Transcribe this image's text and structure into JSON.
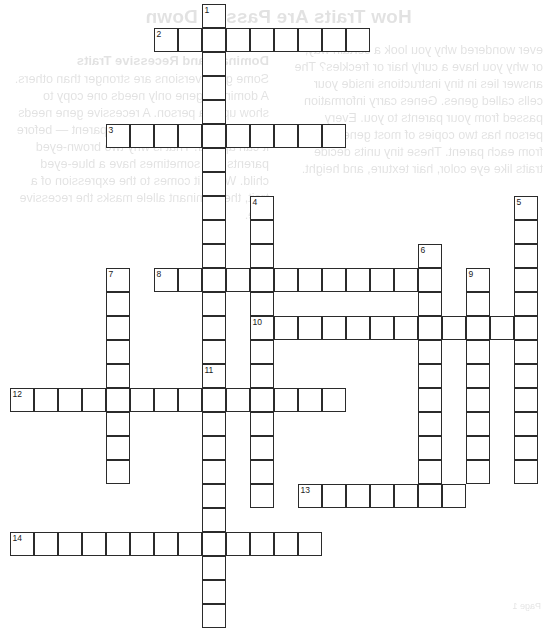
{
  "document": {
    "type": "crossword-puzzle-worksheet",
    "page_width": 557,
    "page_height": 617,
    "cell_size": 24
  },
  "bleed_through": {
    "note": "faint mirrored text showing through from the reverse side of the sheet",
    "title": "How Traits Are Passed Down",
    "left_column": "ever wondered why you look a certain way, or why you have a curly hair or freckles? The answer lies in tiny instructions inside your cells called genes. Genes carry information passed from your parents to you. Every person has two copies of most genes — one from each parent. These tiny units decide traits like eye color, hair texture, and height.",
    "right_heading": "Dominant and Recessive Traits",
    "right_column": "Some gene versions are stronger than others. A dominant gene only needs one copy to show up in a person. A recessive gene needs two copies — one from each parent — before it can appear. That is why two brown-eyed parents can sometimes have a blue-eyed child. When it comes to the expression of a trait, the dominant allele masks the recessive one.",
    "footer": "Page 1"
  },
  "puzzle": {
    "numbers": [
      1,
      2,
      3,
      4,
      5,
      6,
      7,
      8,
      9,
      10,
      11,
      12,
      13,
      14
    ],
    "entries": [
      {
        "number": 1,
        "direction": "down",
        "col": 8,
        "row": 0,
        "length": 17
      },
      {
        "number": 2,
        "direction": "across",
        "col": 6,
        "row": 1,
        "length": 9
      },
      {
        "number": 3,
        "direction": "across",
        "col": 4,
        "row": 5,
        "length": 10
      },
      {
        "number": 4,
        "direction": "down",
        "col": 10,
        "row": 8,
        "length": 13
      },
      {
        "number": 5,
        "direction": "down",
        "col": 21,
        "row": 8,
        "length": 12
      },
      {
        "number": 6,
        "direction": "down",
        "col": 17,
        "row": 10,
        "length": 10
      },
      {
        "number": 7,
        "direction": "down",
        "col": 4,
        "row": 11,
        "length": 9
      },
      {
        "number": 8,
        "direction": "across",
        "col": 6,
        "row": 11,
        "length": 11
      },
      {
        "number": 9,
        "direction": "down",
        "col": 19,
        "row": 11,
        "length": 9
      },
      {
        "number": 10,
        "direction": "across",
        "col": 10,
        "row": 13,
        "length": 11
      },
      {
        "number": 11,
        "direction": "down",
        "col": 8,
        "row": 15,
        "length": 11
      },
      {
        "number": 12,
        "direction": "across",
        "col": 0,
        "row": 16,
        "length": 14
      },
      {
        "number": 13,
        "direction": "across",
        "col": 12,
        "row": 20,
        "length": 7
      },
      {
        "number": 14,
        "direction": "across",
        "col": 0,
        "row": 22,
        "length": 13
      }
    ]
  },
  "colors": {
    "grid_line": "#2b2b2b",
    "cell_fill": "#ffffff",
    "page_background": "#ffffff",
    "number_text": "#1a1a1a",
    "bleed_text": "#2a2a2a"
  }
}
